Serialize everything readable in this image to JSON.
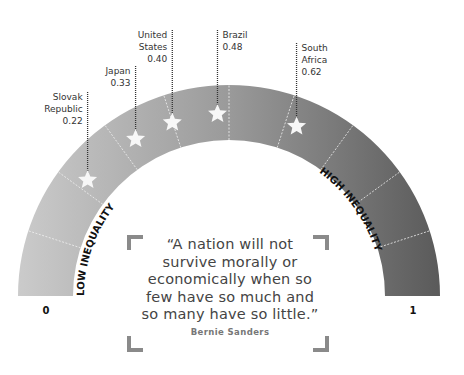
{
  "chart_data": {
    "type": "gauge",
    "title": "",
    "scale": {
      "min": 0,
      "max": 1,
      "min_label": "0",
      "max_label": "1"
    },
    "left_label": "LOW INEQUALITY",
    "right_label": "HIGH INEQUALITY",
    "segments": 10,
    "gradient": {
      "start": "#c8c8c8",
      "end": "#5f5f5f"
    },
    "points": [
      {
        "country": "Slovak Republic",
        "label_lines": [
          "Slovak",
          "Republic",
          "0.22"
        ],
        "value": 0.22
      },
      {
        "country": "Japan",
        "label_lines": [
          "Japan",
          "0.33"
        ],
        "value": 0.33
      },
      {
        "country": "United States",
        "label_lines": [
          "United",
          "States",
          "0.40"
        ],
        "value": 0.4
      },
      {
        "country": "Brazil",
        "label_lines": [
          "Brazil",
          "0.48"
        ],
        "value": 0.48
      },
      {
        "country": "South Africa",
        "label_lines": [
          "South",
          "Africa",
          "0.62"
        ],
        "value": 0.62
      }
    ]
  },
  "quote": {
    "text_lines": [
      "“A nation will not",
      "survive morally or",
      "economically when so",
      "few have so much and",
      "so many have so little.”"
    ],
    "author": "Bernie Sanders"
  }
}
